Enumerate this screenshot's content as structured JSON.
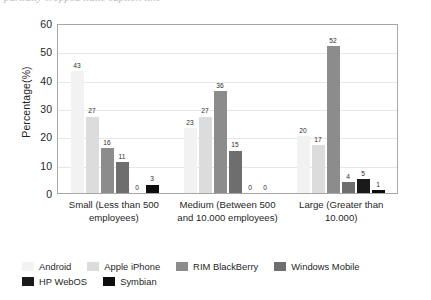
{
  "caption_sliver": "partially cropped italic caption line",
  "chart_data": {
    "type": "bar",
    "title": "",
    "xlabel": "",
    "ylabel": "Percentage(%)",
    "ylim": [
      0,
      60
    ],
    "yticks": [
      0,
      10,
      20,
      30,
      40,
      50,
      60
    ],
    "grid": true,
    "legend_position": "bottom",
    "categories": [
      "Small (Less than 500 employees)",
      "Medium (Between 500 and 10.000 employees)",
      "Large (Greater than 10.000)"
    ],
    "series": [
      {
        "name": "Android",
        "color": "#f2f2f2",
        "values": [
          43,
          23,
          20
        ]
      },
      {
        "name": "Apple iPhone",
        "color": "#dcdcdc",
        "values": [
          27,
          27,
          17
        ]
      },
      {
        "name": "RIM BlackBerry",
        "color": "#8c8c8c",
        "values": [
          16,
          36,
          52
        ]
      },
      {
        "name": "Windows Mobile",
        "color": "#6e6e6e",
        "values": [
          11,
          15,
          4
        ]
      },
      {
        "name": "HP WebOS",
        "color": "#1a1a1a",
        "values": [
          0,
          0,
          5
        ]
      },
      {
        "name": "Symbian",
        "color": "#0d0d0d",
        "values": [
          3,
          0,
          1
        ]
      }
    ]
  }
}
